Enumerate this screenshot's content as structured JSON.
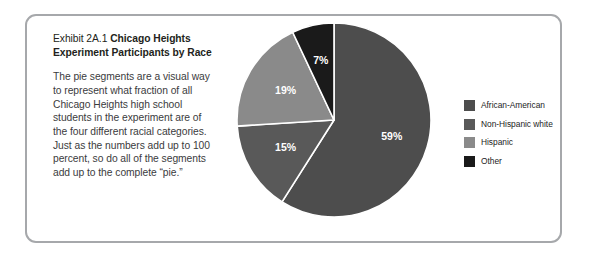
{
  "exhibit": {
    "label": "Exhibit 2A.1",
    "title": "Chicago Heights Experiment Participants by Race",
    "body": "The pie segments are a visual way to represent what fraction of all Chicago Heights high school students in the experiment are of the four different racial categories. Just as the numbers add up to 100 percent, so do all of the segments add up to the complete “pie.”",
    "border_color": "#a6a8ab"
  },
  "chart_data": {
    "type": "pie",
    "title": "Chicago Heights Experiment Participants by Race",
    "categories": [
      "African-American",
      "Non-Hispanic white",
      "Hispanic",
      "Other"
    ],
    "values": [
      59,
      15,
      19,
      7
    ],
    "value_labels": [
      "59%",
      "15%",
      "19%",
      "7%"
    ],
    "colors": [
      "#4d4d4d",
      "#595959",
      "#8a8a8a",
      "#1a1a1a"
    ],
    "legend_position": "right",
    "start_angle_deg": 0,
    "direction": "clockwise",
    "separator_color": "#ffffff",
    "label_color": "#ffffff",
    "units": "percent",
    "total": 100
  },
  "legend": {
    "items": [
      {
        "label": "African-American",
        "color": "#4d4d4d"
      },
      {
        "label": "Non-Hispanic white",
        "color": "#595959"
      },
      {
        "label": "Hispanic",
        "color": "#8a8a8a"
      },
      {
        "label": "Other",
        "color": "#1a1a1a"
      }
    ]
  }
}
